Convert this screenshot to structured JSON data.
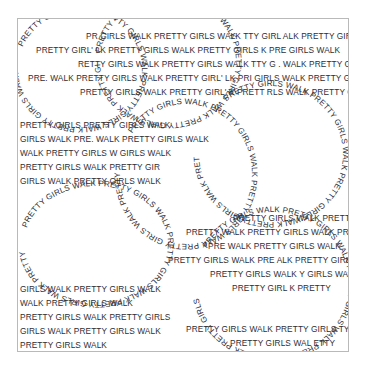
{
  "artwork": {
    "title": "PRETTY GIRLS WALK typographic poster",
    "phrase": "PRETTY GIRLS WALK",
    "background_color": "#ffffff",
    "text_color": "#2e2e35",
    "border_color": "#b9b9b9",
    "canvas": {
      "width": 366,
      "height": 371
    },
    "artboard": {
      "x": 17,
      "y": 18,
      "width": 332,
      "height": 334
    }
  },
  "text_blocks": [
    {
      "name": "top-block",
      "lines": [
        "PR         GIRLS WALK  PRETTY GIRLS WALK        TTY GIRL    ALK  PRETTY GIRLS WALK",
        "PRETTY GIRL'     LK  PRETTY GIRLS WALK  PRETTY GIRLS    K  PRE    GIRLS WALK",
        "RETTY GIRLS WALK  PRETTY GIRLS WALK   TTY G    . WALK  PRETTY GIRLS WALK",
        "PRE.        WALK  PRETTY GIRLS WALK  PRETTY GIRL'   LK  PRI    GIRLS WALK  PRETTY GIRLS WAL",
        "PRETTY GIRLS WALK  PRETTY GIRL'   K  PRETT    RLS WALK  PRETTY GIRLS WALK"
      ]
    },
    {
      "name": "mid-left-block",
      "lines": [
        "PRETTY GIRLS      PRETTY GIRLS WALK",
        "GIRLS WALK  PRE.        WALK  PRETTY GIRLS WALK",
        "WALK  PRETTY GIRLS W        GIRLS WALK",
        "PRETTY GIRLS WALK  PRETTY GIR",
        "GIRLS WALK  PRETTY GIRLS WALK"
      ]
    },
    {
      "name": "bottom-left-block",
      "lines": [
        "GIRLS WALK  PRETTY GIRLS WALK",
        "WALK  PRETTY GIRLS WALK",
        "PRETTY GIRLS WALK  PRETTY GIRLS",
        "GIRLS WALK  PRETTY GIRLS WALK",
        "PRETTY GIRLS WALK"
      ]
    },
    {
      "name": "mid-right-block",
      "lines": [
        "PRETTY GIRLS WALK  PRETTY GIRLS",
        "PRETTY        WALK  PRETTY GIRLS WALK  PRETTY",
        "PRE         WALK  PRETTY GIRLS WALK",
        "PRETTY GIRLS WALK  PRE         ALK  PRETTY GIRLS",
        "PRETTY GIRLS WALK         Y GIRLS WALK",
        "PRETTY GIRL         K  PRETTY"
      ]
    },
    {
      "name": "bottom-right-block",
      "lines": [
        "PRETTY GIRLS WALK  PRETTY GIRLS        TY",
        "PRETTY GIRLS WAL    ETTY"
      ]
    }
  ],
  "curved_paths": [
    {
      "name": "circle-top-left",
      "cx": 62,
      "cy": 50,
      "rx": 62,
      "ry": 58,
      "text": "PRETTY GIRLS WALK PRETTY GIRLS WALK PRETTY GIRLS WALK PRETTY GIRLS WALK PRETTY"
    },
    {
      "name": "circle-top-center",
      "cx": 150,
      "cy": 42,
      "rx": 68,
      "ry": 62,
      "text": "PRETTY GIRLS WALK PRETTY GIRLS WALK PRETTY GIRLS WALK PRETTY GIRLS WALK PRETTY GIRLS"
    },
    {
      "name": "circle-right-upper",
      "cx": 253,
      "cy": 135,
      "rx": 72,
      "ry": 68,
      "text": "PRETTY GIRLS WALK PRETTY GIRLS WALK PRETTY GIRLS WALK PRETTY GIRLS WALK PRETTY GIRLS WALK"
    },
    {
      "name": "circle-center",
      "cx": 168,
      "cy": 155,
      "rx": 66,
      "ry": 70,
      "text": "PRETTY GIRLS WALK PRETTY GIRLS WALK PRETTY GIRLS WALK PRETTY GIRLS WALK PRETTY GIRLS"
    },
    {
      "name": "ellipse-lower-left",
      "cx": 78,
      "cy": 225,
      "rx": 72,
      "ry": 58,
      "text": "PRETTY GIRLS WALK PRETTY GIRLS WALK PRETTY GIRLS WALK PRETTY GIRLS WALK PRETTY"
    },
    {
      "name": "circle-lower-right",
      "cx": 255,
      "cy": 265,
      "rx": 76,
      "ry": 72,
      "text": "PRETTY GIRLS WALK PRETTY GIRLS WALK PRETTY GIRLS WALK PRETTY GIRLS WALK PRETTY GIRLS"
    },
    {
      "name": "arc-bottom-center",
      "cx": 185,
      "cy": 330,
      "rx": 78,
      "ry": 44,
      "text": "GIRLS WALK PRETTY GIRLS WALK PRETTY GIRLS WALK PRETTY GIRLS WALK PRETTY"
    }
  ]
}
